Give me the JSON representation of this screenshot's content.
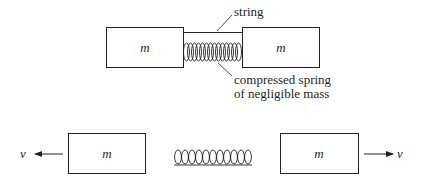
{
  "diagram": {
    "top": {
      "mass_left": "m",
      "mass_right": "m",
      "string_label": "string",
      "spring_label_line1": "compressed spring",
      "spring_label_line2": "of negligible mass"
    },
    "bottom": {
      "mass_left": "m",
      "mass_right": "m",
      "velocity_left": "v",
      "velocity_right": "v"
    },
    "colors": {
      "ink": "#231f20",
      "background": "#ffffff"
    }
  }
}
